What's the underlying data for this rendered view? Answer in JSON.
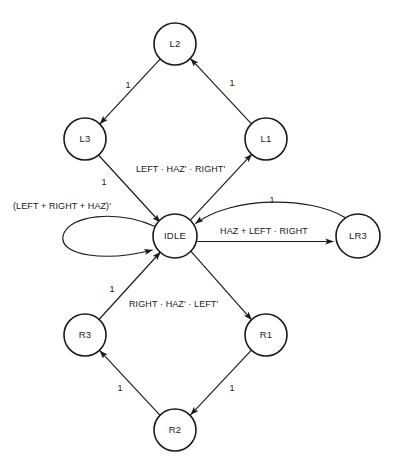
{
  "diagram": {
    "type": "finite-state-machine",
    "title": "",
    "states": [
      {
        "id": "L2",
        "label": "L2",
        "cx": 175,
        "cy": 44,
        "r": 21
      },
      {
        "id": "L3",
        "label": "L3",
        "cx": 85,
        "cy": 139,
        "r": 21
      },
      {
        "id": "L1",
        "label": "L1",
        "cx": 266,
        "cy": 139,
        "r": 21
      },
      {
        "id": "IDLE",
        "label": "IDLE",
        "cx": 175,
        "cy": 236,
        "r": 22
      },
      {
        "id": "LR3",
        "label": "LR3",
        "cx": 358,
        "cy": 236,
        "r": 22
      },
      {
        "id": "R3",
        "label": "R3",
        "cx": 85,
        "cy": 335,
        "r": 21
      },
      {
        "id": "R1",
        "label": "R1",
        "cx": 266,
        "cy": 335,
        "r": 21
      },
      {
        "id": "R2",
        "label": "R2",
        "cx": 175,
        "cy": 430,
        "r": 21
      }
    ],
    "transitions": [
      {
        "id": "t-l2-l3",
        "from": "L2",
        "to": "L3",
        "label": "1",
        "label_x": 128,
        "label_y": 88,
        "anchor": "middle"
      },
      {
        "id": "t-l1-l2",
        "from": "L1",
        "to": "L2",
        "label": "1",
        "label_x": 232,
        "label_y": 86,
        "anchor": "middle"
      },
      {
        "id": "t-l3-idle",
        "from": "L3",
        "to": "IDLE",
        "label": "1",
        "label_x": 104,
        "label_y": 185,
        "anchor": "middle"
      },
      {
        "id": "t-idle-l1",
        "from": "IDLE",
        "to": "L1",
        "label": "LEFT · HAZ' · RIGHT'",
        "label_x": 136,
        "label_y": 172,
        "anchor": "start"
      },
      {
        "id": "t-idle-idle",
        "from": "IDLE",
        "to": "IDLE",
        "label": "(LEFT + RIGHT + HAZ)'",
        "label_x": 13,
        "label_y": 209,
        "anchor": "start"
      },
      {
        "id": "t-idle-lr3",
        "from": "IDLE",
        "to": "LR3",
        "label": "HAZ + LEFT · RIGHT",
        "label_x": 264,
        "label_y": 234,
        "anchor": "middle"
      },
      {
        "id": "t-lr3-idle",
        "from": "LR3",
        "to": "IDLE",
        "label": "1",
        "label_x": 272,
        "label_y": 203,
        "anchor": "middle"
      },
      {
        "id": "t-r3-idle",
        "from": "R3",
        "to": "IDLE",
        "label": "1",
        "label_x": 112,
        "label_y": 292,
        "anchor": "middle"
      },
      {
        "id": "t-idle-r1",
        "from": "IDLE",
        "to": "R1",
        "label": "RIGHT · HAZ' · LEFT'",
        "label_x": 129,
        "label_y": 307,
        "anchor": "start"
      },
      {
        "id": "t-r2-r3",
        "from": "R2",
        "to": "R3",
        "label": "1",
        "label_x": 120,
        "label_y": 391,
        "anchor": "middle"
      },
      {
        "id": "t-r1-r2",
        "from": "R1",
        "to": "R2",
        "label": "1",
        "label_x": 232,
        "label_y": 391,
        "anchor": "middle"
      }
    ],
    "colors": {
      "ink": "#1a1a1a",
      "background": "#ffffff"
    }
  }
}
